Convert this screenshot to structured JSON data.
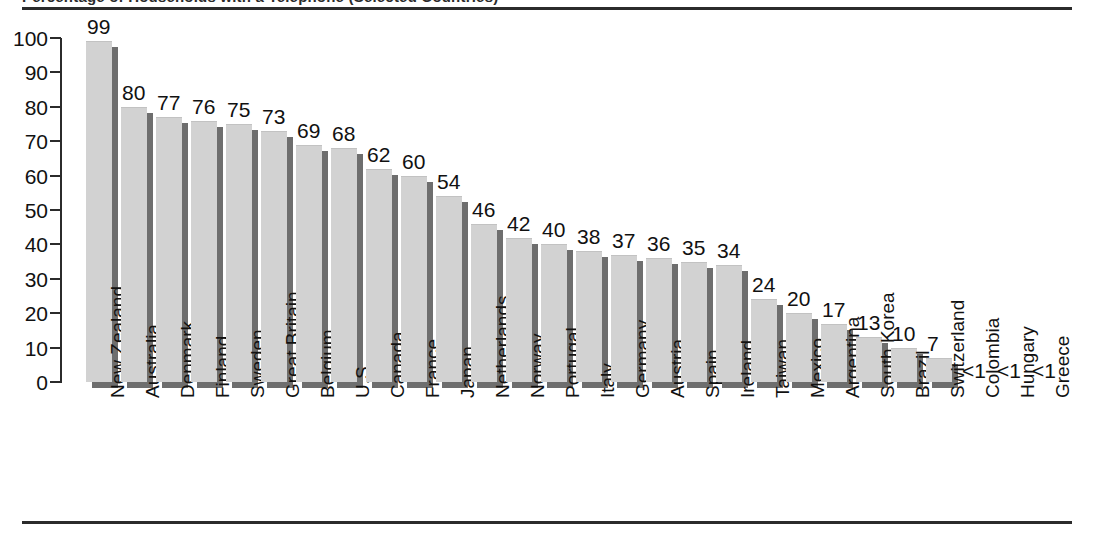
{
  "figure": {
    "title_clipped": "Percentage of Households with a Telephone (Selected Countries)",
    "top_rule": "horizontal-rule",
    "bottom_rule": "horizontal-rule"
  },
  "chart_data": {
    "type": "bar",
    "title": "",
    "xlabel": "",
    "ylabel": "",
    "ylim": [
      0,
      100
    ],
    "ytick_step": 10,
    "yticks": [
      "0",
      "10",
      "20",
      "30",
      "40",
      "50",
      "60",
      "70",
      "80",
      "90",
      "100"
    ],
    "grid": false,
    "legend": "none",
    "orientation": "vertical",
    "bar_style": "3d-shadow",
    "categories": [
      "New Zealand",
      "Australia",
      "Denmark",
      "Finland",
      "Sweden",
      "Great Britain",
      "Belgium",
      "U.S.",
      "Canada",
      "France",
      "Japan",
      "Netherlands",
      "Norway",
      "Portugal",
      "Italy",
      "Germany",
      "Austria",
      "Spain",
      "Ireland",
      "Taiwan",
      "Mexico",
      "Argentina",
      "South Korea",
      "Brazil",
      "Switzerland",
      "Colombia",
      "Hungary",
      "Greece"
    ],
    "values": [
      99,
      80,
      77,
      76,
      75,
      73,
      69,
      68,
      62,
      60,
      54,
      46,
      42,
      40,
      38,
      37,
      36,
      35,
      34,
      24,
      20,
      17,
      13,
      10,
      7,
      0,
      0,
      0
    ],
    "value_labels": [
      "99",
      "80",
      "77",
      "76",
      "75",
      "73",
      "69",
      "68",
      "62",
      "60",
      "54",
      "46",
      "42",
      "40",
      "38",
      "37",
      "36",
      "35",
      "34",
      "24",
      "20",
      "17",
      "13",
      "10",
      "7",
      "<1",
      "<1",
      "<1"
    ]
  },
  "colors": {
    "bar_face": "#d2d2d2",
    "bar_shadow": "#6e6e6e",
    "axis": "#2b2b2b",
    "text": "#111111",
    "background": "#ffffff"
  }
}
